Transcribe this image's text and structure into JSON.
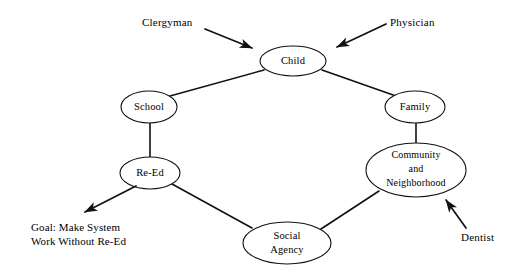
{
  "diagram": {
    "background_color": "#ffffff",
    "stroke_color": "#111111",
    "text_color": "#000000",
    "nodes": [
      {
        "id": "child",
        "label": "Child",
        "lines": [
          "Child"
        ],
        "cx": 293,
        "cy": 61,
        "rx": 33,
        "ry": 15
      },
      {
        "id": "school",
        "label": "School",
        "lines": [
          "School"
        ],
        "cx": 149,
        "cy": 107,
        "rx": 28,
        "ry": 16
      },
      {
        "id": "family",
        "label": "Family",
        "lines": [
          "Family"
        ],
        "cx": 415,
        "cy": 107,
        "rx": 30,
        "ry": 16
      },
      {
        "id": "re-ed",
        "label": "Re-Ed",
        "lines": [
          "Re-Ed"
        ],
        "cx": 150,
        "cy": 173,
        "rx": 30,
        "ry": 16
      },
      {
        "id": "community-and-neighborhood",
        "label": "Community and Neighborhood",
        "lines": [
          "Community",
          "and",
          "Neighborhood"
        ],
        "cx": 416,
        "cy": 170,
        "rx": 50,
        "ry": 27
      },
      {
        "id": "social-agency",
        "label": "Social Agency",
        "lines": [
          "Social",
          "Agency"
        ],
        "cx": 287,
        "cy": 243,
        "rx": 44,
        "ry": 21
      }
    ],
    "links": [
      {
        "id": "school-child",
        "from": "school",
        "to": "child",
        "x1": 170,
        "y1": 96,
        "x2": 264,
        "y2": 70
      },
      {
        "id": "child-family",
        "from": "child",
        "to": "family",
        "x1": 322,
        "y1": 70,
        "x2": 396,
        "y2": 96
      },
      {
        "id": "school-re-ed",
        "from": "school",
        "to": "re-ed",
        "x1": 150,
        "y1": 123,
        "x2": 150,
        "y2": 157
      },
      {
        "id": "family-community",
        "from": "family",
        "to": "community-and-neighborhood",
        "x1": 416,
        "y1": 123,
        "x2": 416,
        "y2": 144
      },
      {
        "id": "re-ed-social-agency",
        "from": "re-ed",
        "to": "social-agency",
        "x1": 172,
        "y1": 184,
        "x2": 252,
        "y2": 228
      },
      {
        "id": "social-agency-community",
        "from": "social-agency",
        "to": "community-and-neighborhood",
        "x1": 321,
        "y1": 229,
        "x2": 379,
        "y2": 191
      }
    ],
    "annotations": [
      {
        "id": "clergyman",
        "label": "Clergyman",
        "text_x": 142,
        "text_y": 26,
        "anchor": "start",
        "arrow": {
          "x1": 205,
          "y1": 29,
          "x2": 254,
          "y2": 49
        },
        "direction": "points-to-child"
      },
      {
        "id": "physician",
        "label": "Physician",
        "text_x": 390,
        "text_y": 26,
        "anchor": "start",
        "arrow": {
          "x1": 386,
          "y1": 24,
          "x2": 335,
          "y2": 48
        },
        "direction": "points-to-child"
      },
      {
        "id": "dentist",
        "label": "Dentist",
        "text_x": 461,
        "text_y": 241,
        "anchor": "start",
        "arrow": {
          "x1": 466,
          "y1": 228,
          "x2": 445,
          "y2": 199
        },
        "direction": "points-to-community"
      }
    ],
    "goal": {
      "id": "goal-note",
      "lines": [
        "Goal: Make System",
        "Work Without Re-Ed"
      ],
      "text_x": 31,
      "text_y_first": 231,
      "text_y_second": 245,
      "arrow": {
        "x1": 136,
        "y1": 186,
        "x2": 83,
        "y2": 213
      },
      "direction": "points-away-from-re-ed"
    }
  }
}
